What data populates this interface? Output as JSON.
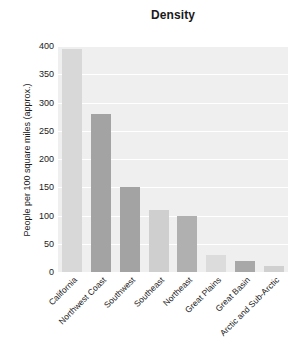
{
  "chart_data": {
    "type": "bar",
    "title": "Density",
    "xlabel": "",
    "ylabel": "People per 100 square miles (approx.)",
    "categories": [
      "California",
      "Northwest Coast",
      "Southwest",
      "Southeast",
      "Northeast",
      "Great Plains",
      "Great Basin",
      "Arctic and Sub-Arctic"
    ],
    "values": [
      395,
      280,
      150,
      110,
      100,
      30,
      20,
      10
    ],
    "ylim": [
      0,
      400
    ],
    "yticks": [
      0,
      50,
      100,
      150,
      200,
      250,
      300,
      350,
      400
    ],
    "ytick_labels": [
      "0",
      "50",
      "100",
      "150",
      "200",
      "250",
      "300",
      "350",
      "400"
    ],
    "grid": true,
    "legend": null,
    "bar_colors": [
      "#d8d8d8",
      "#a3a3a3",
      "#a3a3a3",
      "#cfcfcf",
      "#b0b0b0",
      "#dcdcdc",
      "#a8a8a8",
      "#d0d0d0"
    ],
    "plot_background": "#efefef",
    "gridline_color": "#ffffff",
    "text_color": "#1a1a1a"
  }
}
